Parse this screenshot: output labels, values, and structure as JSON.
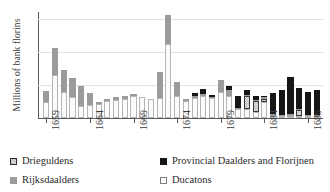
{
  "chart_data": {
    "type": "bar",
    "subtype": "stacked",
    "title": "",
    "xlabel": "",
    "ylabel": "Millions of bank florins",
    "ylim": [
      0,
      6.4
    ],
    "yticks": [
      0,
      2,
      4,
      6
    ],
    "ytick_labels": [
      "0",
      "2",
      "4",
      "6"
    ],
    "grid": true,
    "grid_axis": "y",
    "legend_position": "bottom",
    "x_tick_years": [
      1659,
      1664,
      1669,
      1674,
      1679,
      1684,
      1689
    ],
    "categories": [
      "1659",
      "1660",
      "1661",
      "1662",
      "1663",
      "1664",
      "1665",
      "1666",
      "1667",
      "1668",
      "1669",
      "1670",
      "1671",
      "1672",
      "1673",
      "1674",
      "1675",
      "1676",
      "1677",
      "1678",
      "1679",
      "1680",
      "1681",
      "1682",
      "1683",
      "1684",
      "1685",
      "1686",
      "1687",
      "1688",
      "1689",
      "1690"
    ],
    "series": [
      {
        "name": "Ducatons",
        "color": "#fbfbfb",
        "values": [
          0.95,
          2.6,
          1.6,
          1.25,
          0.75,
          0.8,
          0.85,
          1.05,
          1.1,
          1.15,
          1.35,
          1.25,
          1.15,
          1.2,
          4.45,
          1.35,
          1.05,
          1.2,
          1.35,
          1.2,
          1.55,
          1.35,
          0.55,
          0.55,
          0.35,
          0.95,
          0.2,
          0.1,
          0.1,
          0.1,
          0.1,
          0.1
        ]
      },
      {
        "name": "Drieguldens",
        "color": "#f2f2f2",
        "values": [
          0.0,
          0.0,
          0.0,
          0.0,
          0.0,
          0.0,
          0.0,
          0.0,
          0.0,
          0.0,
          0.0,
          0.0,
          0.0,
          0.0,
          0.0,
          0.0,
          0.0,
          0.0,
          0.0,
          0.0,
          0.0,
          0.0,
          0.0,
          0.75,
          0.65,
          0.2,
          0.0,
          0.0,
          0.0,
          0.35,
          0.0,
          0.0
        ]
      },
      {
        "name": "Rijksdaalders",
        "color": "#9b9b9b",
        "values": [
          0.7,
          1.65,
          1.3,
          1.15,
          1.2,
          0.7,
          0.1,
          0.1,
          0.15,
          0.15,
          0.05,
          0.0,
          0.0,
          1.6,
          1.75,
          0.85,
          0.05,
          0.1,
          0.1,
          0.05,
          0.75,
          0.35,
          0.05,
          0.05,
          0.05,
          0.1,
          0.05,
          0.05,
          0.1,
          0.05,
          0.05,
          0.05
        ]
      },
      {
        "name": "Provincial Daalders and Florijnen",
        "color": "#161616",
        "values": [
          0.0,
          0.0,
          0.0,
          0.0,
          0.0,
          0.0,
          0.0,
          0.0,
          0.0,
          0.0,
          0.0,
          0.0,
          0.0,
          0.0,
          0.0,
          0.0,
          0.0,
          0.2,
          0.3,
          0.1,
          0.0,
          0.25,
          0.7,
          0.3,
          0.25,
          0.1,
          1.25,
          1.5,
          2.25,
          1.25,
          1.35,
          1.5
        ]
      }
    ]
  },
  "legend": {
    "items": [
      {
        "label": "Drieguldens",
        "swatch": "drie"
      },
      {
        "label": "Provincial Daalders and Florijnen",
        "swatch": "prov"
      },
      {
        "label": "Rijksdaalders",
        "swatch": "rijks"
      },
      {
        "label": "Ducatons",
        "swatch": "duc"
      }
    ]
  }
}
